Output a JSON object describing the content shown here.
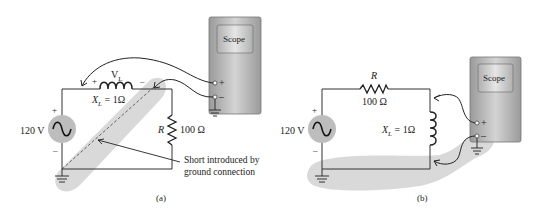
{
  "panel_a": {
    "caption": "(a)",
    "source_voltage": "120 V",
    "source_plus": "+",
    "source_minus": "–",
    "inductor_voltage": "V",
    "inductor_voltage_sub": "L",
    "inductor_plus": "+",
    "inductor_minus": "–",
    "reactance": "X",
    "reactance_sub": "L",
    "reactance_value": " = 1Ω",
    "resistor_name": "R",
    "resistor_value": "100 Ω",
    "scope_label": "Scope",
    "scope_plus": "+",
    "scope_minus": "–",
    "annotation_line1": "Short introduced by",
    "annotation_line2": "ground connection"
  },
  "panel_b": {
    "caption": "(b)",
    "source_voltage": "120 V",
    "source_plus": "+",
    "source_minus": "–",
    "resistor_name": "R",
    "resistor_value": "100 Ω",
    "reactance": "X",
    "reactance_sub": "L",
    "reactance_value": " = 1Ω",
    "scope_label": "Scope",
    "scope_plus": "+",
    "scope_minus": "–"
  },
  "colors": {
    "wire": "#333333",
    "shade": "#d9d9d9",
    "scope_body": "#a8a8a8",
    "source_fill": "#bdbdbd"
  }
}
